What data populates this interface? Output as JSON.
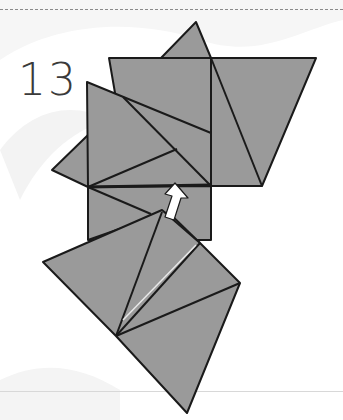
{
  "step": {
    "number": "13"
  },
  "diagram": {
    "fill_color": "#9a9a9a",
    "stroke_color": "#1a1a1a",
    "arrow_color": "#ffffff",
    "arrow_meaning": "push-up / lift flap arrow"
  },
  "page": {
    "top_rule_style": "dashed",
    "top_rule_color": "#8a8a8a"
  }
}
